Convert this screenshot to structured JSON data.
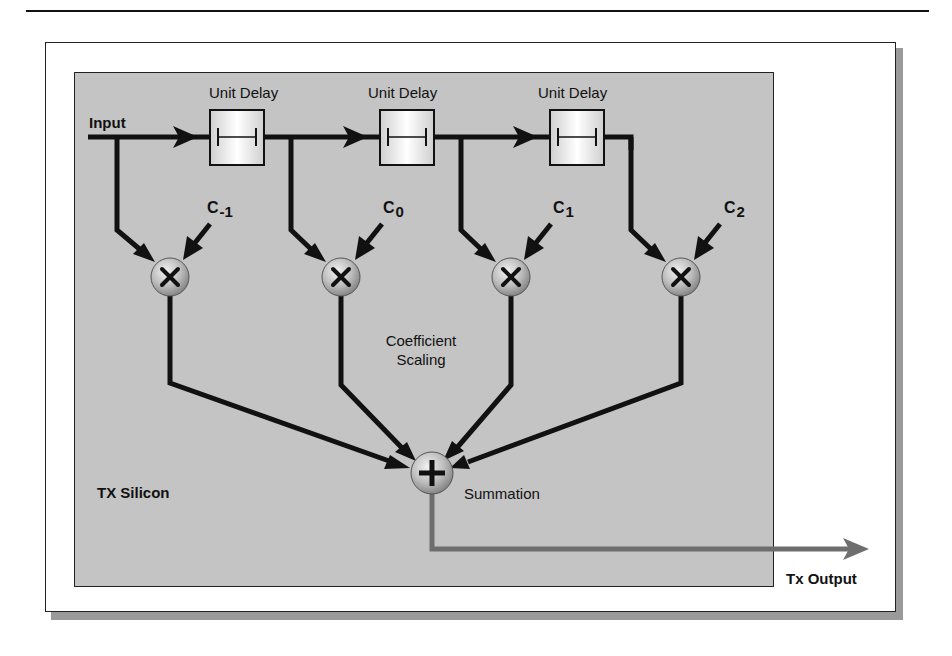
{
  "diagram": {
    "container_label": "TX Silicon",
    "input_label": "Input",
    "output_label": "Tx Output",
    "delay_blocks": [
      {
        "label": "Unit Delay"
      },
      {
        "label": "Unit Delay"
      },
      {
        "label": "Unit Delay"
      }
    ],
    "multipliers": [
      {
        "coef_base": "C",
        "coef_sub": "-1",
        "symbol": "×"
      },
      {
        "coef_base": "C",
        "coef_sub": "0",
        "symbol": "×"
      },
      {
        "coef_base": "C",
        "coef_sub": "1",
        "symbol": "×"
      },
      {
        "coef_base": "C",
        "coef_sub": "2",
        "symbol": "×"
      }
    ],
    "coefficient_label_line1": "Coefficient",
    "coefficient_label_line2": "Scaling",
    "summation_label": "Summation",
    "summation_symbol": "+",
    "colors": {
      "panel": "#c4c4c4",
      "signal": "#111111",
      "output_signal": "#707070",
      "node": "#b8b8b8",
      "frame_shadow": "#9a9a9a"
    }
  }
}
